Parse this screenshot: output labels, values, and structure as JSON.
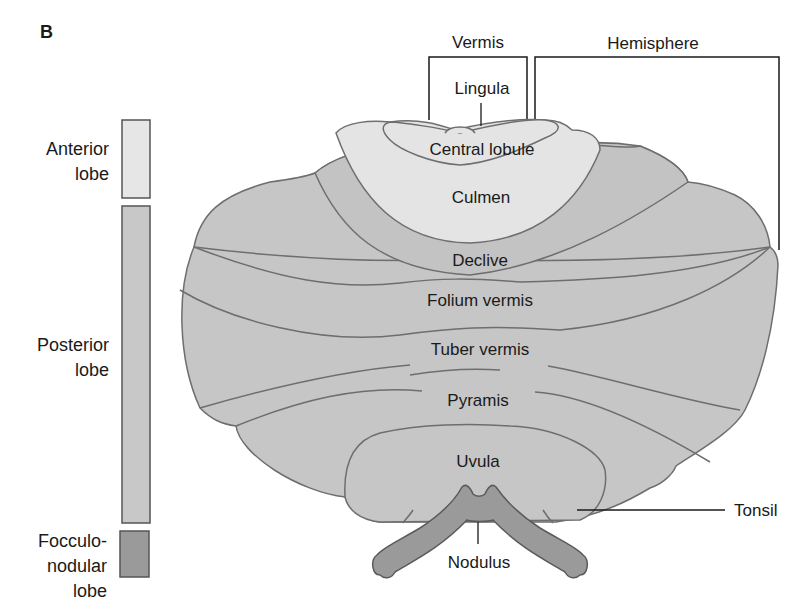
{
  "figure": {
    "panel_letter": "B",
    "colors": {
      "anterior": "#e6e6e6",
      "posterior": "#c8c8c8",
      "posterior_dark": "#bfbfbf",
      "flocculonodular": "#9a9a9a",
      "outline": "#6a6a6a",
      "leader": "#1a1a1a"
    }
  },
  "legend": {
    "items": [
      {
        "label_line1": "Anterior",
        "label_line2": "lobe",
        "color": "#e6e6e6"
      },
      {
        "label_line1": "Posterior",
        "label_line2": "lobe",
        "color": "#c8c8c8"
      },
      {
        "label_line1": "Focculo-",
        "label_line2": "nodular",
        "label_line3": "lobe",
        "color": "#9a9a9a"
      }
    ]
  },
  "brackets": {
    "vermis": "Vermis",
    "hemisphere": "Hemisphere"
  },
  "labels": {
    "lingula": "Lingula",
    "central_lobule": "Central lobule",
    "culmen": "Culmen",
    "declive": "Declive",
    "folium_vermis": "Folium vermis",
    "tuber_vermis": "Tuber vermis",
    "pyramis": "Pyramis",
    "uvula": "Uvula",
    "tonsil": "Tonsil",
    "nodulus": "Nodulus"
  }
}
